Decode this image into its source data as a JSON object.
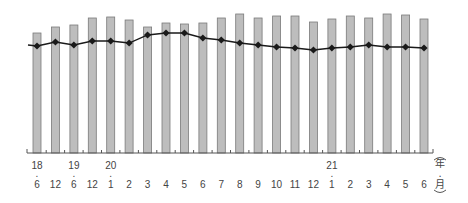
{
  "chart_data": {
    "type": "bar",
    "title": "",
    "xlabel": "(年・月)",
    "ylabel": "",
    "grid": false,
    "legend": null,
    "categories": [
      "18・6",
      "12",
      "19・6",
      "12",
      "20・1",
      "2",
      "3",
      "4",
      "5",
      "6",
      "7",
      "8",
      "9",
      "10",
      "11",
      "12",
      "21・1",
      "2",
      "3",
      "4",
      "5",
      "6"
    ],
    "tick_labels": {
      "year_row": [
        "18",
        "",
        "19",
        "",
        "20",
        "",
        "",
        "",
        "",
        "",
        "",
        "",
        "",
        "",
        "",
        "",
        "21",
        "",
        "",
        "",
        "",
        ""
      ],
      "month_row": [
        "6",
        "12",
        "6",
        "12",
        "1",
        "2",
        "3",
        "4",
        "5",
        "6",
        "7",
        "8",
        "9",
        "10",
        "11",
        "12",
        "1",
        "2",
        "3",
        "4",
        "5",
        "6"
      ]
    },
    "series": [
      {
        "name": "bars",
        "type": "bar",
        "color": "#bdbdbd",
        "values": [
          120,
          126,
          128,
          135,
          136,
          133,
          126,
          130,
          129,
          130,
          135,
          139,
          135,
          137,
          137,
          131,
          134,
          137,
          135,
          139,
          138,
          134
        ]
      },
      {
        "name": "line",
        "type": "line",
        "color": "#1a1a1a",
        "marker": "diamond",
        "values": [
          107,
          111,
          108,
          112,
          112,
          110,
          118,
          120,
          120,
          115,
          113,
          110,
          108,
          106,
          105,
          103,
          105,
          106,
          108,
          106,
          106,
          105
        ]
      }
    ],
    "ylim": [
      0,
      153
    ]
  },
  "axis": {
    "unit_label_chars": [
      "(",
      "年",
      "・",
      "月",
      ")"
    ],
    "dot": "・"
  }
}
